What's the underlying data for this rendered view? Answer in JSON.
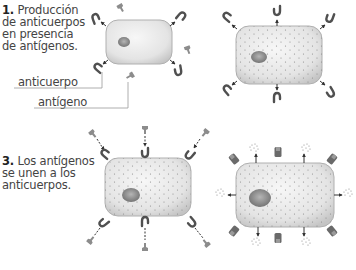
{
  "steps": [
    {
      "number": "1.",
      "text_lines": [
        "Producción",
        "de anticuerpos",
        "en presencia",
        "de antígenos."
      ]
    },
    {
      "number": "3.",
      "text_lines": [
        "Los antígenos",
        "se unen a los",
        "anticuerpos."
      ]
    }
  ],
  "labels": {
    "antibody": "anticuerpo",
    "antigen": "antígeno"
  },
  "colors": {
    "cell_fill": "#e6e6e6",
    "cell_stroke": "#9a9a9a",
    "nucleus": "#8a8a8a",
    "antibody": "#555555",
    "antigen": "#8c8c8c",
    "leader_line": "#9a9a9a"
  }
}
